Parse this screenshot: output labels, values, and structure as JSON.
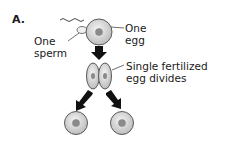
{
  "panel_label": "A.",
  "labels": {
    "egg": [
      "One",
      "egg"
    ],
    "sperm": [
      "One",
      "sperm"
    ],
    "divides": [
      "Single fertilized",
      "egg divides"
    ]
  },
  "colors": {
    "cell_fill": "#d4d4d4",
    "cell_stroke": "#5a5a5a",
    "nucleus": "#8a8a8a",
    "arrow": "#111111"
  }
}
